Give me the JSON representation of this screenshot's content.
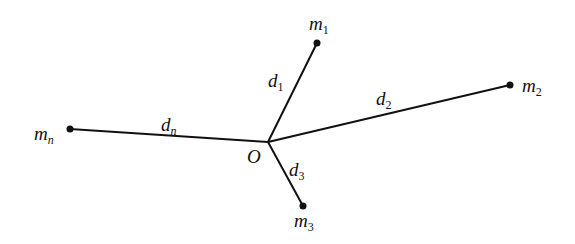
{
  "diagram": {
    "origin": {
      "label": "O",
      "x": 268,
      "y": 142
    },
    "masses": [
      {
        "id": "m1",
        "base": "m",
        "sub": "1",
        "x": 317,
        "y": 43,
        "distance": {
          "base": "d",
          "sub": "1"
        }
      },
      {
        "id": "m2",
        "base": "m",
        "sub": "2",
        "x": 510,
        "y": 85,
        "distance": {
          "base": "d",
          "sub": "2"
        }
      },
      {
        "id": "m3",
        "base": "m",
        "sub": "3",
        "x": 303,
        "y": 206,
        "distance": {
          "base": "d",
          "sub": "3"
        }
      },
      {
        "id": "mn",
        "base": "m",
        "sub": "n",
        "x": 70,
        "y": 129,
        "distance": {
          "base": "d",
          "sub": "n"
        }
      }
    ],
    "line_color": "#111111"
  }
}
